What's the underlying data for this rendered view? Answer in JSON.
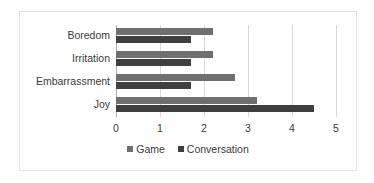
{
  "chart_data": {
    "type": "bar",
    "orientation": "horizontal",
    "title": "",
    "xlabel": "",
    "ylabel": "",
    "xlim": [
      0,
      5
    ],
    "xticks": [
      "0",
      "1",
      "2",
      "3",
      "4",
      "5"
    ],
    "grid": true,
    "legend_position": "bottom-center",
    "categories": [
      "Boredom",
      "Irritation",
      "Embarrassment",
      "Joy"
    ],
    "series": [
      {
        "name": "Game",
        "color": "#6f6f6f",
        "values": [
          2.2,
          2.2,
          2.7,
          3.2
        ]
      },
      {
        "name": "Conversation",
        "color": "#3f3f3f",
        "values": [
          1.7,
          1.7,
          1.7,
          4.5
        ]
      }
    ]
  },
  "legend": {
    "items": [
      {
        "label": "Game",
        "swatch": "legend-swatch-game"
      },
      {
        "label": "Conversation",
        "swatch": "legend-swatch-conversation"
      }
    ]
  },
  "frame": {
    "border_color": "#e3e3e3",
    "gridline_color": "#d9d9d9",
    "axis_color": "#b0b0b0",
    "text_color": "#3a3a3a"
  }
}
